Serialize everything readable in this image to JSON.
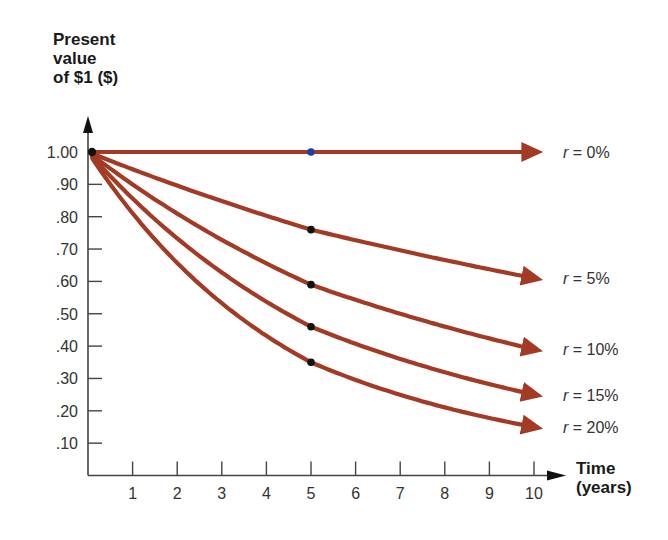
{
  "chart_data": {
    "type": "line",
    "title": "",
    "ylabel": "Present value of $1 ($)",
    "ylabel_lines": [
      "Present",
      "value",
      "of $1 ($)"
    ],
    "xlabel": "Time (years)",
    "xlabel_lines": [
      "Time",
      "(years)"
    ],
    "x_ticks": [
      "1",
      "2",
      "3",
      "4",
      "5",
      "6",
      "7",
      "8",
      "9",
      "10"
    ],
    "y_ticks": [
      "1.00",
      ".90",
      ".80",
      ".70",
      ".60",
      ".50",
      ".40",
      ".30",
      ".20",
      ".10"
    ],
    "xlim": [
      0,
      10
    ],
    "ylim": [
      0,
      1.0
    ],
    "grid": false,
    "legend_position": "inline-right",
    "x": [
      0,
      5,
      10
    ],
    "series": [
      {
        "name": "r = 0%",
        "rate": 0.0,
        "values": [
          1.0,
          1.0,
          1.0
        ],
        "marker_at_5_color": "#1f3fa8"
      },
      {
        "name": "r = 5%",
        "rate": 0.05,
        "values": [
          1.0,
          0.76,
          0.61
        ]
      },
      {
        "name": "r = 10%",
        "rate": 0.1,
        "values": [
          1.0,
          0.59,
          0.39
        ]
      },
      {
        "name": "r = 15%",
        "rate": 0.15,
        "values": [
          1.0,
          0.46,
          0.25
        ]
      },
      {
        "name": "r = 20%",
        "rate": 0.2,
        "values": [
          1.0,
          0.35,
          0.15
        ]
      }
    ],
    "annotations": [
      "Dots mark each curve at t = 5 years"
    ],
    "colors": {
      "line": "#a33a24",
      "marker": "#111111",
      "marker_zero_rate": "#1f3fa8",
      "axis": "#444444"
    }
  }
}
